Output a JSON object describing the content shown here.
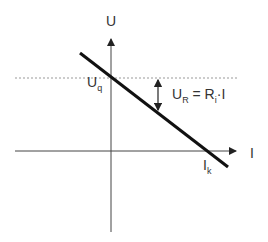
{
  "diagram": {
    "axis_y_label": "U",
    "axis_x_label": "I",
    "intercept_u": {
      "main": "U",
      "sub": "q"
    },
    "intercept_i": {
      "main": "I",
      "sub": "k"
    },
    "drop_label": {
      "lhs_main": "U",
      "lhs_sub": "R",
      "eq": " = ",
      "rhs_main": "R",
      "rhs_sub": "i",
      "rhs_tail": "·I"
    },
    "colors": {
      "line": "#111111",
      "axis": "#444444",
      "dashed": "#999999"
    }
  }
}
